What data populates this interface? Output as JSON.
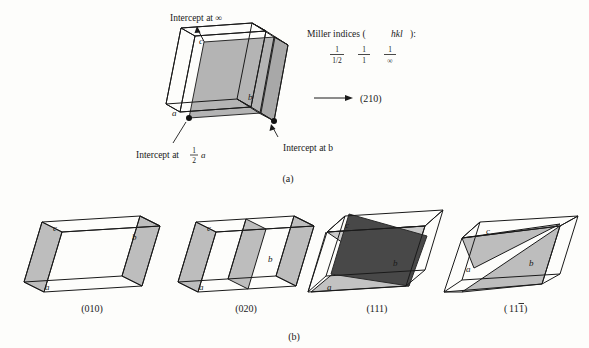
{
  "figure": {
    "title_a": "(a)",
    "title_b": "(b)",
    "axis_labels": {
      "a": "a",
      "b": "b",
      "c": "c"
    }
  },
  "panel_a": {
    "annotations": {
      "intercept_infinity": "Intercept at ∞",
      "intercept_half_a_prefix": "Intercept at",
      "intercept_half_a_value": "a",
      "intercept_b": "Intercept at b"
    },
    "miller_heading_prefix": "Miller indices (",
    "miller_heading_italic": "hkl",
    "miller_heading_suffix": "):",
    "reciprocals": [
      {
        "numerator": "1",
        "denominator": "1/2"
      },
      {
        "numerator": "1",
        "denominator": "1"
      },
      {
        "numerator": "1",
        "denominator": "∞"
      }
    ],
    "result_index": "(210)",
    "arrow_icon": "right-arrow-icon"
  },
  "panel_b": {
    "cells": [
      {
        "index_label": "(010)",
        "planes": 2,
        "name": "cell-010"
      },
      {
        "index_label": "(020)",
        "planes": 3,
        "name": "cell-020"
      },
      {
        "index_label": "(111)",
        "planes": 3,
        "name": "cell-111"
      },
      {
        "index_label": "(11̀1)",
        "index_digits": "11",
        "barred_digit": "1",
        "planes": 2,
        "name": "cell-111bar"
      }
    ]
  },
  "colors": {
    "background": "#fdfdfb",
    "line": "#1a1a1a",
    "plane_mid": "#b4b4b4",
    "plane_light": "#c9c9c9",
    "plane_dark": "#484848",
    "text": "#1a1a1a"
  }
}
